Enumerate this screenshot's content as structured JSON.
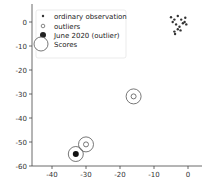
{
  "chart_data": {
    "type": "scatter",
    "title": "",
    "xlabel": "",
    "ylabel": "",
    "xlim": [
      -45,
      3
    ],
    "ylim": [
      -60,
      5
    ],
    "xticks": [
      -40,
      -30,
      -20,
      -10,
      0
    ],
    "yticks": [
      0,
      -10,
      -20,
      -30,
      -40,
      -50,
      -60
    ],
    "xtick_labels": [
      "-40",
      "-30",
      "-20",
      "-10",
      "0"
    ],
    "ytick_labels": [
      "0",
      "-10",
      "-20",
      "-30",
      "-40",
      "-50",
      "-60"
    ],
    "grid": false,
    "legend_position": "top-left",
    "legend": [
      {
        "label": "ordinary observation",
        "marker": "small-dot"
      },
      {
        "label": "outliers",
        "marker": "hollow-small-circle"
      },
      {
        "label": "June 2020 (outlier)",
        "marker": "large-dot"
      },
      {
        "label": "Scores",
        "marker": "large-hollow-circle"
      }
    ],
    "series": [
      {
        "name": "ordinary observation",
        "points": [
          [
            -5,
            2
          ],
          [
            -4,
            1
          ],
          [
            -3,
            2.5
          ],
          [
            -2,
            1
          ],
          [
            -1,
            0
          ],
          [
            -0.5,
            -1
          ],
          [
            -3.5,
            -1
          ],
          [
            -2.5,
            -2
          ],
          [
            -1.5,
            -0.5
          ],
          [
            -4.5,
            0
          ],
          [
            -0.8,
            1.8
          ],
          [
            -3,
            -3
          ],
          [
            -4,
            -4
          ],
          [
            -3.8,
            -5
          ],
          [
            -2.2,
            -3.5
          ]
        ]
      },
      {
        "name": "outliers",
        "points": [
          [
            -16,
            -31
          ],
          [
            -30,
            -51
          ]
        ]
      },
      {
        "name": "June 2020 (outlier)",
        "points": [
          [
            -33,
            -55
          ]
        ]
      },
      {
        "name": "Scores",
        "points": [
          [
            -16,
            -31
          ],
          [
            -30,
            -51
          ],
          [
            -33,
            -55
          ]
        ]
      }
    ]
  }
}
